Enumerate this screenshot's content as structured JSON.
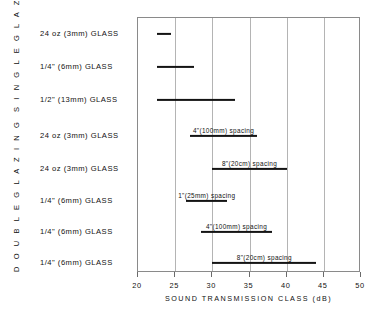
{
  "chart_data": {
    "type": "bar",
    "orientation": "horizontal-range",
    "title": "",
    "xlabel": "SOUND TRANSMISSION CLASS (dB)",
    "ylabel": "",
    "xlim": [
      20,
      50
    ],
    "xticks": [
      20,
      25,
      30,
      35,
      40,
      45,
      50
    ],
    "grid": true,
    "legend": null,
    "groups": [
      {
        "name": "SINGLE GLAZING",
        "rows": [
          0,
          1,
          2
        ]
      },
      {
        "name": "DOUBLE GLAZING",
        "rows": [
          3,
          4,
          5,
          6,
          7
        ]
      }
    ],
    "categories": [
      "24 oz (3mm) GLASS",
      "1/4\" (6mm) GLASS",
      "1/2\" (13mm) GLASS",
      "24 oz (3mm) GLASS",
      "24 oz (3mm) GLASS",
      "1/4\" (6mm) GLASS",
      "1/4\" (6mm) GLASS",
      "1/4\" (6mm) GLASS"
    ],
    "bars": [
      {
        "label": "24 oz (3mm) GLASS",
        "group": "SINGLE GLAZING",
        "start": 22.5,
        "end": 24.5,
        "note": ""
      },
      {
        "label": "1/4\" (6mm) GLASS",
        "group": "SINGLE GLAZING",
        "start": 22.5,
        "end": 27.5,
        "note": ""
      },
      {
        "label": "1/2\" (13mm) GLASS",
        "group": "SINGLE GLAZING",
        "start": 22.5,
        "end": 33.0,
        "note": ""
      },
      {
        "label": "24 oz (3mm) GLASS",
        "group": "DOUBLE GLAZING",
        "start": 27.0,
        "end": 36.0,
        "note": "4\"(100mm) spacing"
      },
      {
        "label": "24 oz (3mm) GLASS",
        "group": "DOUBLE GLAZING",
        "start": 30.0,
        "end": 40.0,
        "note": "8\"(20cm) spacing"
      },
      {
        "label": "1/4\" (6mm) GLASS",
        "group": "DOUBLE GLAZING",
        "start": 26.5,
        "end": 32.0,
        "note": "1\"(25mm) spacing"
      },
      {
        "label": "1/4\" (6mm) GLASS",
        "group": "DOUBLE GLAZING",
        "start": 28.5,
        "end": 38.0,
        "note": "4\"(100mm) spacing"
      },
      {
        "label": "1/4\" (6mm) GLASS",
        "group": "DOUBLE GLAZING",
        "start": 30.0,
        "end": 44.0,
        "note": "8\"(20cm) spacing"
      }
    ]
  },
  "labels": {
    "group_single": "S I N G L E  G L A Z I N G",
    "group_double": "D O U B L E  G L A Z I N G",
    "rows": [
      "24 oz (3mm)  GLASS",
      "1/4\" (6mm)  GLASS",
      "1/2\" (13mm)  GLASS",
      "24 oz (3mm)  GLASS",
      "24 oz (3mm)  GLASS",
      "1/4\" (6mm)  GLASS",
      "1/4\" (6mm)  GLASS",
      "1/4\" (6mm)  GLASS"
    ],
    "x_axis_title": "SOUND  TRANSMISSION  CLASS  (dB)",
    "x_tick_labels": [
      "20",
      "25",
      "30",
      "35",
      "40",
      "45",
      "50"
    ]
  },
  "colors": {
    "bar": "#141414",
    "grid": "#b4b4b4",
    "frame": "#8a8a8a",
    "text": "#111111",
    "background": "#ffffff"
  }
}
